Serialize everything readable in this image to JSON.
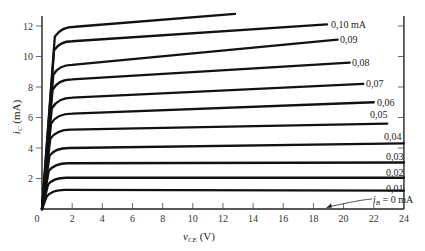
{
  "chart_data": {
    "type": "line",
    "title": "",
    "xlabel": "v_CE (V)",
    "ylabel": "i_C (mA)",
    "xlim": [
      0,
      24
    ],
    "ylim": [
      0,
      12.8
    ],
    "xticks": [
      0,
      2,
      4,
      6,
      8,
      10,
      12,
      14,
      16,
      18,
      20,
      22,
      24
    ],
    "yticks": [
      2,
      4,
      6,
      8,
      10,
      12
    ],
    "grid": false,
    "legend": "inline labels at curve ends",
    "series": [
      {
        "name": "i_B = 0 mA",
        "label": "i_B = 0 mA",
        "points": [
          [
            0,
            0
          ],
          [
            24,
            0
          ]
        ]
      },
      {
        "name": "0.01",
        "label": "0.01",
        "points": [
          [
            0,
            0
          ],
          [
            0.3,
            0.8
          ],
          [
            0.8,
            1.2
          ],
          [
            1.5,
            1.25
          ],
          [
            24,
            1.2
          ]
        ]
      },
      {
        "name": "0.02",
        "label": "0.02",
        "points": [
          [
            0,
            0
          ],
          [
            0.4,
            1.6
          ],
          [
            0.9,
            2.0
          ],
          [
            1.6,
            2.05
          ],
          [
            24,
            2.05
          ]
        ]
      },
      {
        "name": "0.03",
        "label": "0.03",
        "points": [
          [
            0,
            0
          ],
          [
            0.45,
            2.5
          ],
          [
            1.0,
            2.95
          ],
          [
            1.7,
            3.0
          ],
          [
            24,
            3.05
          ]
        ]
      },
      {
        "name": "0.04",
        "label": "0.04",
        "points": [
          [
            0,
            0
          ],
          [
            0.5,
            3.5
          ],
          [
            1.0,
            3.95
          ],
          [
            1.8,
            4.0
          ],
          [
            24,
            4.3
          ]
        ]
      },
      {
        "name": "0.05",
        "label": "0.05",
        "points": [
          [
            0,
            0
          ],
          [
            0.55,
            4.6
          ],
          [
            1.1,
            5.1
          ],
          [
            1.9,
            5.2
          ],
          [
            22.9,
            5.6
          ]
        ]
      },
      {
        "name": "0.06",
        "label": "0.06",
        "points": [
          [
            0,
            0
          ],
          [
            0.6,
            5.6
          ],
          [
            1.1,
            6.1
          ],
          [
            2.0,
            6.25
          ],
          [
            22.0,
            7.0
          ]
        ]
      },
      {
        "name": "0.07",
        "label": "0.07",
        "points": [
          [
            0,
            0
          ],
          [
            0.65,
            6.6
          ],
          [
            1.2,
            7.15
          ],
          [
            2.0,
            7.3
          ],
          [
            21.3,
            8.2
          ]
        ]
      },
      {
        "name": "0.08",
        "label": "0.08",
        "points": [
          [
            0,
            0
          ],
          [
            0.7,
            7.8
          ],
          [
            1.2,
            8.35
          ],
          [
            2.0,
            8.5
          ],
          [
            20.4,
            9.6
          ]
        ]
      },
      {
        "name": "0.09",
        "label": "0.09",
        "points": [
          [
            0,
            0
          ],
          [
            0.75,
            8.8
          ],
          [
            1.25,
            9.3
          ],
          [
            2.0,
            9.45
          ],
          [
            19.6,
            11.1
          ]
        ]
      },
      {
        "name": "0.10",
        "label": "0.10 mA",
        "points": [
          [
            0,
            0
          ],
          [
            0.8,
            10.4
          ],
          [
            1.3,
            10.9
          ],
          [
            2.0,
            11.0
          ],
          [
            18.9,
            12.1
          ]
        ]
      },
      {
        "name": "0.11",
        "label": "",
        "points": [
          [
            0,
            0
          ],
          [
            0.85,
            11.3
          ],
          [
            1.4,
            11.85
          ],
          [
            2.2,
            11.95
          ],
          [
            12.8,
            12.8
          ]
        ]
      }
    ],
    "annotations": [
      {
        "text": "i_B = 0 mA",
        "arrow_to": [
          18.9,
          0.1
        ]
      }
    ]
  },
  "labels": {
    "x_axis_main": "v",
    "x_axis_sub": "CE",
    "x_axis_unit": " (V)",
    "y_axis_main": "i",
    "y_axis_sub": "C",
    "y_axis_unit": " (mA)",
    "ib_main": "i",
    "ib_sub": "B",
    "ib_rest": " = 0 mA"
  }
}
